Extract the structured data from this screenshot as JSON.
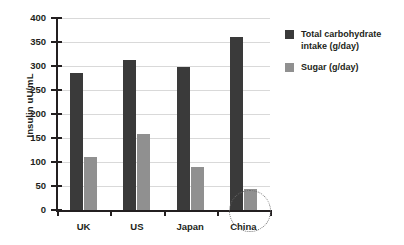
{
  "chart_data": {
    "type": "bar",
    "title": "",
    "xlabel": "",
    "ylabel": "Insulin uU/mL",
    "ylim": [
      0,
      400
    ],
    "yticks": [
      0,
      50,
      100,
      150,
      200,
      250,
      300,
      350,
      400
    ],
    "ytick_labels": [
      "0",
      "50",
      "100",
      "150",
      "200",
      "250",
      "300",
      "350",
      "400"
    ],
    "grid": true,
    "legend_position": "right",
    "categories": [
      "UK",
      "US",
      "Japan",
      "China"
    ],
    "series": [
      {
        "name": "Total carbohydrate intake (g/day)",
        "color": "#3a3a3a",
        "values": [
          285,
          313,
          297,
          360
        ]
      },
      {
        "name": "Sugar (g/day)",
        "color": "#909090",
        "values": [
          111,
          158,
          90,
          44
        ]
      }
    ],
    "annotations": [
      {
        "kind": "dotted-circle",
        "target": "China / Sugar (g/day)",
        "color": "#6d6d6d"
      }
    ]
  }
}
